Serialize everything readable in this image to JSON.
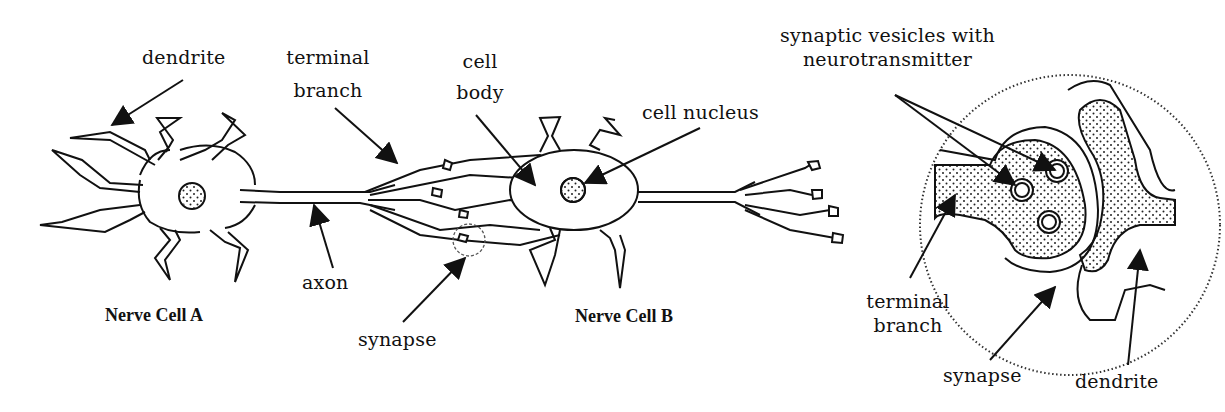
{
  "diagram": {
    "type": "anatomical-illustration",
    "colors": {
      "line": "#111111",
      "background": "#ffffff",
      "stipple": "#222222"
    }
  },
  "cells": {
    "a": {
      "title": "Nerve Cell A"
    },
    "b": {
      "title": "Nerve Cell B"
    }
  },
  "labels": {
    "dendrite_left": "dendrite",
    "terminal_branch_line1": "terminal",
    "terminal_branch_line2": "branch",
    "axon": "axon",
    "cell_body_line1": "cell",
    "cell_body_line2": "body",
    "cell_nucleus": "cell nucleus",
    "synapse_main": "synapse"
  },
  "inset": {
    "vesicles_line1": "synaptic vesicles with",
    "vesicles_line2": "neurotransmitter",
    "terminal_branch_line1": "terminal",
    "terminal_branch_line2": "branch",
    "synapse": "synapse",
    "dendrite": "dendrite"
  }
}
